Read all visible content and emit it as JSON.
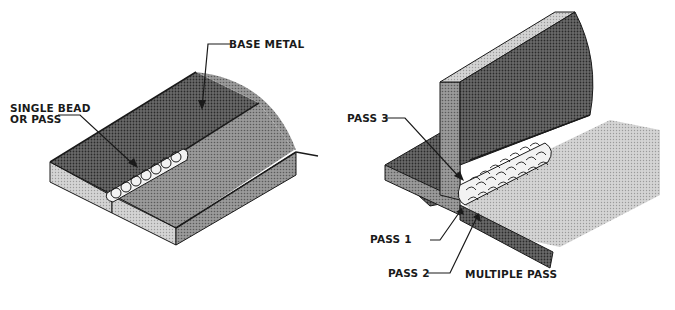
{
  "diagram": {
    "panels": [
      {
        "id": "single",
        "labels": {
          "base_metal": "BASE METAL",
          "single_bead_line1": "SINGLE BEAD",
          "single_bead_line2": "OR PASS"
        }
      },
      {
        "id": "multiple",
        "labels": {
          "pass3": "PASS 3",
          "pass1": "PASS 1",
          "pass2": "PASS 2",
          "caption": "MULTIPLE PASS"
        }
      }
    ],
    "colors": {
      "outline": "#1a1a1a",
      "dark_face": "#4a4a4a",
      "mid_face": "#8c8c8c",
      "light_face": "#c8c8c8",
      "bead": "#f2f2f2",
      "background": "#ffffff"
    }
  }
}
